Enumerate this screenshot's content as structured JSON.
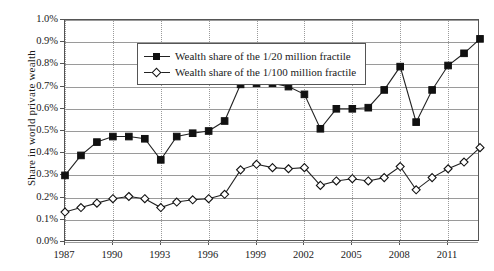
{
  "chart_data": {
    "type": "line",
    "title": "",
    "xlabel": "",
    "ylabel": "Share in world private wealth",
    "xlim": [
      1987,
      2013
    ],
    "ylim": [
      0.0,
      1.0
    ],
    "ytick_labels": [
      "0.0%",
      "0.1%",
      "0.2%",
      "0.3%",
      "0.4%",
      "0.5%",
      "0.6%",
      "0.7%",
      "0.8%",
      "0.9%",
      "1.0%"
    ],
    "ytick_values": [
      0.0,
      0.1,
      0.2,
      0.3,
      0.4,
      0.5,
      0.6,
      0.7,
      0.8,
      0.9,
      1.0
    ],
    "xtick_labels": [
      "1987",
      "1990",
      "1993",
      "1996",
      "1999",
      "2002",
      "2005",
      "2008",
      "2011"
    ],
    "xtick_values": [
      1987,
      1990,
      1993,
      1996,
      1999,
      2002,
      2005,
      2008,
      2011
    ],
    "grid": "horizontal solid, vertical dotted at xticks",
    "legend_position": "upper-left inside plot",
    "x": [
      1987,
      1988,
      1989,
      1990,
      1991,
      1992,
      1993,
      1994,
      1995,
      1996,
      1997,
      1998,
      1999,
      2000,
      2001,
      2002,
      2003,
      2004,
      2005,
      2006,
      2007,
      2008,
      2009,
      2010,
      2011,
      2012,
      2013
    ],
    "series": [
      {
        "name": "Wealth share of the 1/20 million fractile",
        "marker": "filled-square",
        "values": [
          0.3,
          0.39,
          0.45,
          0.475,
          0.475,
          0.465,
          0.37,
          0.475,
          0.49,
          0.5,
          0.545,
          0.71,
          0.715,
          0.715,
          0.7,
          0.665,
          0.51,
          0.6,
          0.6,
          0.605,
          0.685,
          0.79,
          0.54,
          0.685,
          0.795,
          0.85,
          0.915
        ]
      },
      {
        "name": "Wealth share of the 1/100 million fractile",
        "marker": "open-diamond",
        "values": [
          0.135,
          0.155,
          0.175,
          0.195,
          0.205,
          0.195,
          0.155,
          0.18,
          0.19,
          0.195,
          0.215,
          0.325,
          0.35,
          0.335,
          0.33,
          0.335,
          0.255,
          0.275,
          0.285,
          0.275,
          0.29,
          0.34,
          0.235,
          0.29,
          0.33,
          0.36,
          0.425
        ]
      }
    ]
  },
  "legend": {
    "items": [
      {
        "label": "Wealth share of the 1/20 million fractile"
      },
      {
        "label": "Wealth share of the 1/100 million fractile"
      }
    ]
  }
}
